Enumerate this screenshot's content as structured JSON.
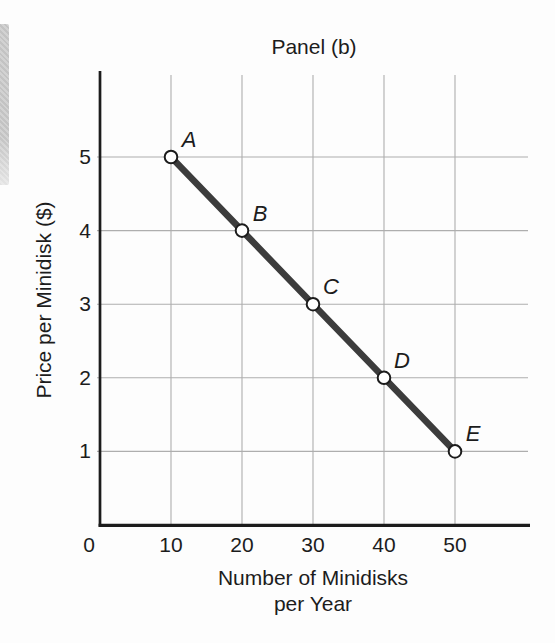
{
  "chart_data": {
    "type": "line",
    "title": "Panel (b)",
    "xlabel_lines": [
      "Number of Minidisks",
      "per Year"
    ],
    "ylabel": "Price per Minidisk ($)",
    "x_ticks": [
      0,
      10,
      20,
      30,
      40,
      50
    ],
    "y_ticks": [
      1,
      2,
      3,
      4,
      5
    ],
    "xlim": [
      0,
      60
    ],
    "ylim": [
      0,
      6
    ],
    "grid": true,
    "legend": "none",
    "points": [
      {
        "label": "A",
        "x": 10,
        "y": 5
      },
      {
        "label": "B",
        "x": 20,
        "y": 4
      },
      {
        "label": "C",
        "x": 30,
        "y": 3
      },
      {
        "label": "D",
        "x": 40,
        "y": 2
      },
      {
        "label": "E",
        "x": 50,
        "y": 1
      }
    ],
    "series": [
      {
        "name": "demand-curve",
        "x": [
          10,
          20,
          30,
          40,
          50
        ],
        "y": [
          5,
          4,
          3,
          2,
          1
        ]
      }
    ],
    "colors": {
      "line": "#3c3c3c",
      "grid": "#aeaeae",
      "axis": "#1c1c1c",
      "text": "#1c1c1c",
      "point_fill": "#ffffff",
      "point_stroke": "#1c1c1c",
      "background": "#fdfdfd",
      "page_edge": "#c6c6c6"
    }
  }
}
